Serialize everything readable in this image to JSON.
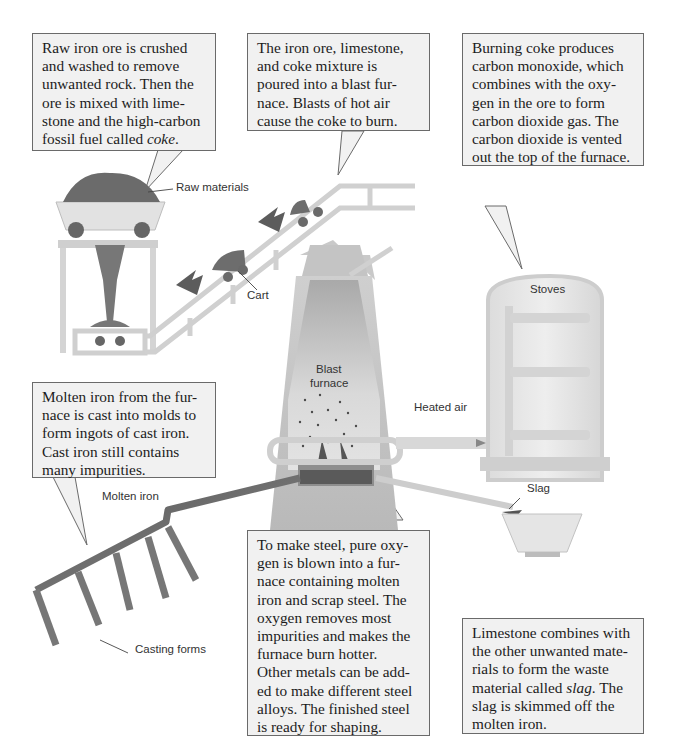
{
  "diagram": {
    "callouts": {
      "raw_ore": {
        "text_parts": [
          "Raw iron ore is crushed and washed to remove unwanted rock. Then the ore is mixed with lime-stone and the high-carbon fossil fuel called ",
          "coke",
          "."
        ],
        "lines": [
          "Raw iron ore is crushed",
          "and washed to remove",
          "unwanted rock. Then the",
          "ore is mixed with lime-",
          "stone and the high-carbon",
          "fossil fuel called coke."
        ]
      },
      "blast_furnace": {
        "lines": [
          "The iron ore, limestone,",
          "and coke mixture is",
          "poured into a blast fur-",
          "nace. Blasts of hot air",
          "cause the coke to burn."
        ]
      },
      "coke": {
        "lines": [
          "Burning coke produces",
          "carbon monoxide, which",
          "combines with the oxy-",
          "gen in the ore to form",
          "carbon dioxide gas. The",
          "carbon dioxide is vented",
          "out the top of the furnace."
        ]
      },
      "molten_iron": {
        "lines": [
          "Molten iron from the fur-",
          "nace is cast into molds to",
          "form ingots of cast iron.",
          "Cast iron still contains",
          "many impurities."
        ]
      },
      "steel": {
        "lines": [
          "To make steel, pure oxy-",
          "gen is blown into a fur-",
          "nace containing  molten",
          "iron and scrap steel. The",
          "oxygen removes most",
          "impurities and makes the",
          "furnace burn hotter.",
          "Other metals can be add-",
          "ed to make different steel",
          "alloys. The finished steel",
          "is ready for shaping."
        ]
      },
      "slag": {
        "line1": "Limestone combines with",
        "line2": "the other unwanted mate-",
        "line3": "rials to form the waste",
        "line4_pre": "material called ",
        "line4_em": "slag",
        "line4_post": ". The",
        "line5": "slag is skimmed off the",
        "line6": "molten iron."
      }
    },
    "labels": {
      "raw_materials": "Raw materials",
      "cart": "Cart",
      "blast_furnace_1": "Blast",
      "blast_furnace_2": "furnace",
      "stoves": "Stoves",
      "heated_air": "Heated air",
      "molten_iron": "Molten iron",
      "slag": "Slag",
      "casting_forms": "Casting forms"
    },
    "colors": {
      "callout_bg": "#f1f1f1",
      "callout_border": "#6a6a6a",
      "structure": "#c8c8c8",
      "ore": "#6e6e6e",
      "molten": "#5a5a5a"
    }
  }
}
